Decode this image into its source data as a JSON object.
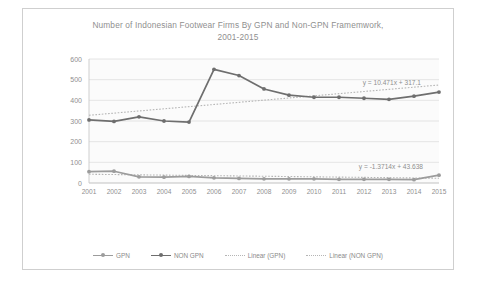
{
  "chart_data": {
    "type": "line",
    "title": "Number of Indonesian Footwear Firms By GPN and Non-GPN Framemwork, 2001-2015",
    "title_line1": "Number of Indonesian Footwear Firms By GPN and Non-GPN Framemwork,",
    "title_line2": "2001-2015",
    "xlabel": "",
    "ylabel": "",
    "ylim": [
      0,
      600
    ],
    "ytick_step": 100,
    "yticks": [
      "0",
      "100",
      "200",
      "300",
      "400",
      "500",
      "600"
    ],
    "categories": [
      "2001",
      "2002",
      "2003",
      "2004",
      "2005",
      "2006",
      "2007",
      "2008",
      "2009",
      "2010",
      "2011",
      "2012",
      "2013",
      "2014",
      "2015"
    ],
    "grid": true,
    "legend_position": "bottom",
    "series": [
      {
        "name": "GPN",
        "color": "#9c9c9c",
        "values": [
          55,
          57,
          30,
          28,
          32,
          25,
          22,
          20,
          20,
          20,
          18,
          18,
          18,
          16,
          38
        ]
      },
      {
        "name": "NON GPN",
        "color": "#6e6e6e",
        "values": [
          305,
          298,
          320,
          300,
          295,
          550,
          520,
          455,
          425,
          415,
          415,
          410,
          405,
          420,
          440
        ]
      }
    ],
    "trendlines": [
      {
        "name": "Linear (GPN)",
        "equation": "y = -1.3714x + 43.638",
        "slope": -1.3714,
        "intercept": 43.638,
        "color": "#b5b5b5"
      },
      {
        "name": "Linear (NON GPN)",
        "equation": "y = 10.471x + 317.1",
        "slope": 10.471,
        "intercept": 317.1,
        "color": "#b5b5b5"
      }
    ],
    "annotations": [
      {
        "text": "y = 10.471x + 317.1",
        "series": "Linear (NON GPN)"
      },
      {
        "text": "y = -1.3714x + 43.638",
        "series": "Linear (GPN)"
      }
    ],
    "legend": [
      {
        "label": "GPN",
        "kind": "line-marker",
        "color": "#9c9c9c"
      },
      {
        "label": "NON GPN",
        "kind": "line-marker",
        "color": "#6e6e6e"
      },
      {
        "label": "Linear (GPN)",
        "kind": "dotted",
        "color": "#b5b5b5"
      },
      {
        "label": "Linear (NON GPN)",
        "kind": "dotted",
        "color": "#b5b5b5"
      }
    ]
  }
}
